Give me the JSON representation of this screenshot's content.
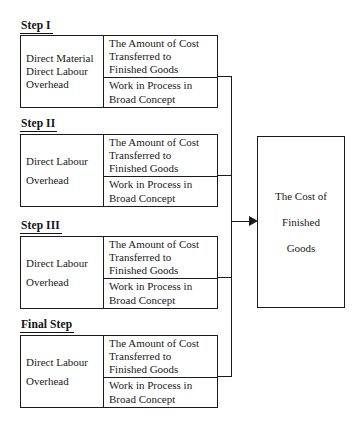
{
  "diagram": {
    "title_visible": false,
    "colors": {
      "line": "#1b1b1b",
      "text": "#1a1a1a",
      "background": "#ffffff"
    },
    "steps": [
      {
        "label": "Step I",
        "inputs": [
          "Direct Material",
          "Direct Labour",
          "Overhead"
        ],
        "transferred": [
          "The Amount of Cost",
          "Transferred to",
          "Finished Goods"
        ],
        "wip": [
          "Work in Process in",
          "Broad Concept"
        ]
      },
      {
        "label": "Step II",
        "inputs": [
          "Direct Labour",
          "Overhead"
        ],
        "transferred": [
          "The Amount of Cost",
          "Transferred to",
          "Finished Goods"
        ],
        "wip": [
          "Work in Process in",
          "Broad Concept"
        ]
      },
      {
        "label": "Step III",
        "inputs": [
          "Direct Labour",
          "Overhead"
        ],
        "transferred": [
          "The Amount of Cost",
          "Transferred to",
          "Finished Goods"
        ],
        "wip": [
          "Work in Process in",
          "Broad Concept"
        ]
      },
      {
        "label": "Final Step",
        "inputs": [
          "Direct Labour",
          "Overhead"
        ],
        "transferred": [
          "The Amount of Cost",
          "Transferred to",
          "Finished Goods"
        ],
        "wip": [
          "Work in Process in",
          "Broad Concept"
        ]
      }
    ],
    "result": {
      "lines": [
        "The Cost of",
        "Finished",
        "Goods"
      ]
    }
  }
}
